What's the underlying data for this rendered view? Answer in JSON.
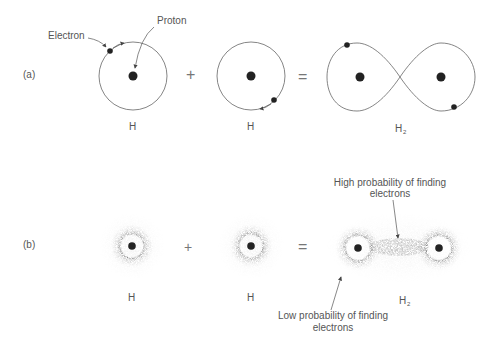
{
  "diagram": {
    "panel_a": {
      "label": "(a)",
      "atom1": {
        "caption": "H"
      },
      "atom2": {
        "caption": "H"
      },
      "molecule": {
        "caption": "H",
        "subscript": "2"
      },
      "operators": {
        "plus": "+",
        "equals": "="
      },
      "annotations": {
        "electron": "Electron",
        "proton": "Proton"
      }
    },
    "panel_b": {
      "label": "(b)",
      "atom1": {
        "caption": "H"
      },
      "atom2": {
        "caption": "H"
      },
      "molecule": {
        "caption": "H",
        "subscript": "2"
      },
      "operators": {
        "plus": "+",
        "equals": "="
      },
      "annotations": {
        "high_line1": "High probability of finding",
        "high_line2": "electrons",
        "low_line1": "Low probability of finding",
        "low_line2": "electrons"
      }
    },
    "colors": {
      "ink": "#222222",
      "line": "#666666",
      "text": "#555555"
    }
  }
}
